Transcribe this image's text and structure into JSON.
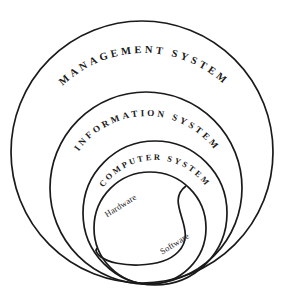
{
  "diagram": {
    "type": "nested-venn",
    "background_color": "#ffffff",
    "stroke_color": "#1a1a1a",
    "rings": [
      {
        "id": "management-system",
        "label": "MANAGEMENT SYSTEM",
        "level": 1,
        "cx": 142,
        "cy": 152,
        "r": 131
      },
      {
        "id": "information-system",
        "label": "INFORMATION SYSTEM",
        "level": 2,
        "cx": 146,
        "cy": 188,
        "r": 96
      },
      {
        "id": "computer-system",
        "label": "COMPUTER SYSTEM",
        "level": 3,
        "cx": 155,
        "cy": 213,
        "r": 72
      }
    ],
    "inner": {
      "id": "computer-parts",
      "cx": 150,
      "cy": 228,
      "r": 56,
      "parts": [
        {
          "id": "hardware",
          "label": "Hardware",
          "position": "upper-left",
          "rotation": -32
        },
        {
          "id": "software",
          "label": "Software",
          "position": "lower-right",
          "rotation": -32
        }
      ]
    }
  }
}
